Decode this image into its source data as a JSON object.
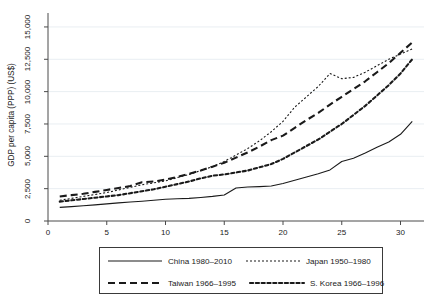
{
  "chart_data": {
    "type": "line",
    "title": "",
    "xlabel": "",
    "ylabel": "GDP per capita (PPP) (US$)",
    "xlim": [
      0,
      32
    ],
    "ylim": [
      0,
      16000
    ],
    "xticks": [
      "0",
      "5",
      "10",
      "15",
      "20",
      "25",
      "30"
    ],
    "xtick_values": [
      0,
      5,
      10,
      15,
      20,
      25,
      30
    ],
    "yticks": [
      "0",
      "2,500",
      "5,000",
      "7,500",
      "10,000",
      "12,500",
      "15,000"
    ],
    "ytick_values": [
      0,
      2500,
      5000,
      7500,
      10000,
      12500,
      15000
    ],
    "grid": "horizontal",
    "legend_position": "below-center",
    "x": [
      1,
      2,
      3,
      4,
      5,
      6,
      7,
      8,
      9,
      10,
      11,
      12,
      13,
      14,
      15,
      16,
      17,
      18,
      19,
      20,
      21,
      22,
      23,
      24,
      25,
      26,
      27,
      28,
      29,
      30,
      31
    ],
    "series": [
      {
        "name": "China 1980-2010",
        "label": "China 1980–2010",
        "style": "solid",
        "color": "#1a1a1a",
        "values": [
          1050,
          1110,
          1180,
          1250,
          1320,
          1400,
          1470,
          1530,
          1600,
          1680,
          1720,
          1750,
          1820,
          1900,
          2010,
          2550,
          2630,
          2660,
          2700,
          2900,
          3150,
          3400,
          3650,
          3950,
          4600,
          4850,
          5250,
          5700,
          6100,
          6700,
          7700
        ]
      },
      {
        "name": "Japan 1950-1980",
        "label": "Japan 1950–1980",
        "style": "dotted",
        "color": "#1a1a1a",
        "values": [
          1600,
          1750,
          1900,
          2050,
          2200,
          2400,
          2600,
          2800,
          2950,
          3100,
          3350,
          3600,
          3900,
          4200,
          4600,
          5100,
          5600,
          6200,
          6900,
          7700,
          8800,
          9600,
          10400,
          11400,
          11000,
          11100,
          11500,
          12000,
          12500,
          12900,
          13300
        ]
      },
      {
        "name": "Taiwan 1966-1995",
        "label": "Taiwan 1966–1995",
        "style": "dashed",
        "color": "#1a1a1a",
        "values": [
          1900,
          2000,
          2100,
          2250,
          2400,
          2550,
          2700,
          3000,
          3050,
          3200,
          3400,
          3650,
          3900,
          4200,
          4500,
          4900,
          5300,
          5750,
          6250,
          6600,
          7200,
          7800,
          8350,
          9000,
          9600,
          10200,
          10800,
          11500,
          12200,
          13000,
          13800
        ]
      },
      {
        "name": "S. Korea 1966-1996",
        "label": "S. Korea 1966–1996",
        "style": "dash-dot",
        "color": "#1a1a1a",
        "values": [
          1500,
          1600,
          1700,
          1800,
          1900,
          2000,
          2150,
          2300,
          2450,
          2650,
          2850,
          3050,
          3300,
          3500,
          3600,
          3750,
          3900,
          4150,
          4400,
          4800,
          5300,
          5800,
          6300,
          6900,
          7500,
          8200,
          8900,
          9700,
          10500,
          11400,
          12500
        ]
      }
    ]
  },
  "axis": {
    "y_title": "GDP per capita (PPP) (US$)"
  },
  "legend": {
    "entries": [
      {
        "label": "China 1980–2010",
        "style": "solid"
      },
      {
        "label": "Japan 1950–1980",
        "style": "dotted"
      },
      {
        "label": "Taiwan 1966–1995",
        "style": "dashed"
      },
      {
        "label": "S. Korea 1966–1996",
        "style": "dash-dot"
      }
    ]
  }
}
